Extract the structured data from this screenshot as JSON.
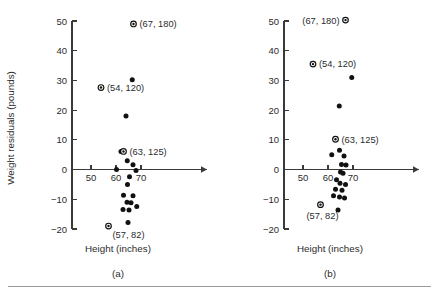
{
  "figure": {
    "bottom_rule": true,
    "panels": [
      {
        "key": "a",
        "subcaption": "(a)",
        "xlabel": "Height (inches)",
        "ylabel": "Weight residuals (pounds)",
        "show_ylabel": true
      },
      {
        "key": "b",
        "subcaption": "(b)",
        "xlabel": "Height (inches)",
        "ylabel": "",
        "show_ylabel": false
      }
    ]
  },
  "chart_data": [
    {
      "type": "scatter",
      "panel": "a",
      "title": "",
      "subtitle": "(a)",
      "xlabel": "Height (inches)",
      "ylabel": "Weight residuals (pounds)",
      "xlim": [
        44,
        78
      ],
      "ylim": [
        -20,
        50
      ],
      "xticks": [
        50,
        60,
        70
      ],
      "yticks": [
        -20,
        -10,
        0,
        10,
        20,
        30,
        40,
        50
      ],
      "xtick_labels": [
        "50",
        "60",
        "70"
      ],
      "ytick_labels": [
        "-20",
        "-10",
        "0",
        "10",
        "20",
        "30",
        "40",
        "50"
      ],
      "grid": false,
      "legend": "none",
      "x_axis_at_y": 0,
      "x_axis_arrow": true,
      "points": [
        {
          "x": 67.0,
          "y": 49.0,
          "marker": "ringed"
        },
        {
          "x": 66.5,
          "y": 30.2,
          "marker": "dot"
        },
        {
          "x": 54.0,
          "y": 27.6,
          "marker": "ringed"
        },
        {
          "x": 64.0,
          "y": 18.0,
          "marker": "dot"
        },
        {
          "x": 62.0,
          "y": 6.1,
          "marker": "dot"
        },
        {
          "x": 63.0,
          "y": 6.1,
          "marker": "ringed"
        },
        {
          "x": 64.5,
          "y": 3.0,
          "marker": "dot"
        },
        {
          "x": 66.8,
          "y": 1.6,
          "marker": "dot"
        },
        {
          "x": 60.2,
          "y": 0.0,
          "marker": "dot"
        },
        {
          "x": 68.0,
          "y": -0.3,
          "marker": "dot"
        },
        {
          "x": 65.4,
          "y": -2.4,
          "marker": "dot"
        },
        {
          "x": 64.6,
          "y": -5.0,
          "marker": "dot"
        },
        {
          "x": 63.0,
          "y": -8.6,
          "marker": "dot"
        },
        {
          "x": 66.8,
          "y": -8.8,
          "marker": "dot"
        },
        {
          "x": 64.4,
          "y": -11.0,
          "marker": "dot"
        },
        {
          "x": 66.0,
          "y": -11.2,
          "marker": "dot"
        },
        {
          "x": 68.3,
          "y": -12.4,
          "marker": "dot"
        },
        {
          "x": 62.8,
          "y": -13.4,
          "marker": "dot"
        },
        {
          "x": 65.2,
          "y": -13.6,
          "marker": "dot"
        },
        {
          "x": 64.8,
          "y": -17.8,
          "marker": "dot"
        },
        {
          "x": 57.0,
          "y": -19.0,
          "marker": "ringed"
        }
      ],
      "annotations": [
        {
          "text": "(67, 180)",
          "x": 67.0,
          "y": 49.0,
          "anchor": "right"
        },
        {
          "text": "(54, 120)",
          "x": 54.0,
          "y": 27.6,
          "anchor": "right"
        },
        {
          "text": "(63, 125)",
          "x": 63.0,
          "y": 6.1,
          "anchor": "right"
        },
        {
          "text": "(57, 82)",
          "x": 57.0,
          "y": -19.0,
          "anchor": "below-right"
        }
      ]
    },
    {
      "type": "scatter",
      "panel": "b",
      "title": "",
      "subtitle": "(b)",
      "xlabel": "Height (inches)",
      "ylabel": "",
      "xlim": [
        44,
        78
      ],
      "ylim": [
        -20,
        50
      ],
      "xticks": [
        50,
        60,
        70
      ],
      "yticks": [
        -20,
        -10,
        0,
        10,
        20,
        30,
        40,
        50
      ],
      "xtick_labels": [
        "50",
        "60",
        "70"
      ],
      "ytick_labels": [
        "-20",
        "-10",
        "0",
        "10",
        "20",
        "30",
        "40",
        "50"
      ],
      "grid": false,
      "legend": "none",
      "x_axis_at_y": 0,
      "x_axis_arrow": true,
      "points": [
        {
          "x": 67.0,
          "y": 50.3,
          "marker": "ringed"
        },
        {
          "x": 54.0,
          "y": 35.5,
          "marker": "ringed"
        },
        {
          "x": 69.5,
          "y": 31.0,
          "marker": "dot"
        },
        {
          "x": 64.5,
          "y": 21.4,
          "marker": "dot"
        },
        {
          "x": 63.0,
          "y": 10.2,
          "marker": "ringed"
        },
        {
          "x": 64.6,
          "y": 6.5,
          "marker": "dot"
        },
        {
          "x": 61.5,
          "y": 5.0,
          "marker": "dot"
        },
        {
          "x": 66.4,
          "y": 4.6,
          "marker": "dot"
        },
        {
          "x": 65.4,
          "y": 1.7,
          "marker": "dot"
        },
        {
          "x": 67.2,
          "y": 1.5,
          "marker": "dot"
        },
        {
          "x": 65.0,
          "y": -0.8,
          "marker": "dot"
        },
        {
          "x": 66.0,
          "y": -1.2,
          "marker": "dot"
        },
        {
          "x": 63.4,
          "y": -3.4,
          "marker": "dot"
        },
        {
          "x": 64.8,
          "y": -4.6,
          "marker": "dot"
        },
        {
          "x": 67.0,
          "y": -5.0,
          "marker": "dot"
        },
        {
          "x": 63.0,
          "y": -6.6,
          "marker": "dot"
        },
        {
          "x": 65.6,
          "y": -7.0,
          "marker": "dot"
        },
        {
          "x": 62.2,
          "y": -8.8,
          "marker": "dot"
        },
        {
          "x": 64.6,
          "y": -9.2,
          "marker": "dot"
        },
        {
          "x": 66.6,
          "y": -9.6,
          "marker": "dot"
        },
        {
          "x": 57.0,
          "y": -11.8,
          "marker": "ringed"
        },
        {
          "x": 64.0,
          "y": -13.6,
          "marker": "dot"
        }
      ],
      "annotations": [
        {
          "text": "(67, 180)",
          "x": 67.0,
          "y": 50.3,
          "anchor": "left"
        },
        {
          "text": "(54, 120)",
          "x": 54.0,
          "y": 35.5,
          "anchor": "right"
        },
        {
          "text": "(63, 125)",
          "x": 63.0,
          "y": 10.2,
          "anchor": "right"
        },
        {
          "text": "(57, 82)",
          "x": 57.0,
          "y": -11.8,
          "anchor": "below-left"
        }
      ]
    }
  ]
}
